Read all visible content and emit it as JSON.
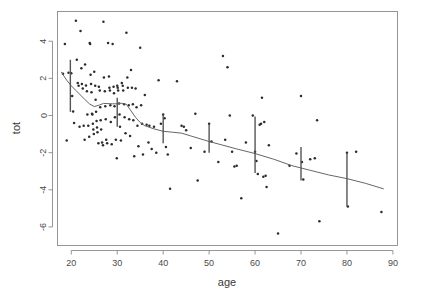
{
  "chart_data": {
    "type": "scatter",
    "title": "",
    "xlabel": "age",
    "ylabel": "tot",
    "xlim": [
      17,
      91
    ],
    "ylim": [
      -7,
      5.6
    ],
    "grid": false,
    "legend": "none",
    "xticks": [
      20,
      30,
      40,
      50,
      60,
      70,
      80,
      90
    ],
    "yticks": [
      4,
      2,
      0,
      -2,
      -4,
      -6
    ],
    "xtick_labels": [
      "20",
      "30",
      "40",
      "50",
      "60",
      "70",
      "80",
      "90"
    ],
    "ytick_labels": [
      "4",
      "2",
      "0",
      "-2",
      "-4",
      "-6"
    ],
    "series": [
      {
        "name": "observations",
        "type": "scatter",
        "marker": "dot",
        "color": "#2b2b2b",
        "points": [
          [
            18.2,
            2.25
          ],
          [
            18.6,
            3.85
          ],
          [
            19.0,
            -1.35
          ],
          [
            19.4,
            2.3
          ],
          [
            20.0,
            2.28
          ],
          [
            20.2,
            1.05
          ],
          [
            20.4,
            0.22
          ],
          [
            20.6,
            -0.4
          ],
          [
            21.0,
            5.1
          ],
          [
            21.2,
            3.0
          ],
          [
            21.4,
            1.75
          ],
          [
            21.6,
            1.6
          ],
          [
            21.8,
            -0.6
          ],
          [
            22.0,
            4.55
          ],
          [
            22.2,
            2.55
          ],
          [
            22.3,
            1.7
          ],
          [
            22.5,
            1.45
          ],
          [
            22.7,
            -0.55
          ],
          [
            22.9,
            -1.3
          ],
          [
            23.0,
            2.75
          ],
          [
            23.2,
            1.62
          ],
          [
            23.4,
            1.3
          ],
          [
            23.5,
            0.05
          ],
          [
            23.7,
            -0.55
          ],
          [
            23.9,
            -1.15
          ],
          [
            24.0,
            3.9
          ],
          [
            24.1,
            3.85
          ],
          [
            24.2,
            2.2
          ],
          [
            24.3,
            1.7
          ],
          [
            24.4,
            1.25
          ],
          [
            24.5,
            0.1
          ],
          [
            24.6,
            0.05
          ],
          [
            24.7,
            -0.45
          ],
          [
            24.8,
            -0.75
          ],
          [
            24.9,
            -1.0
          ],
          [
            25.0,
            2.35
          ],
          [
            25.2,
            1.6
          ],
          [
            25.3,
            0.85
          ],
          [
            25.4,
            0.2
          ],
          [
            25.5,
            -0.3
          ],
          [
            25.6,
            -0.65
          ],
          [
            25.7,
            -0.9
          ],
          [
            25.9,
            -1.5
          ],
          [
            26.0,
            1.55
          ],
          [
            26.2,
            1.35
          ],
          [
            26.3,
            0.45
          ],
          [
            26.4,
            -0.25
          ],
          [
            26.5,
            -0.75
          ],
          [
            26.7,
            -1.45
          ],
          [
            26.9,
            -1.6
          ],
          [
            27.0,
            5.05
          ],
          [
            27.1,
            2.05
          ],
          [
            27.3,
            1.3
          ],
          [
            27.4,
            0.5
          ],
          [
            27.5,
            -0.2
          ],
          [
            27.6,
            -1.3
          ],
          [
            27.8,
            -1.5
          ],
          [
            28.0,
            3.9
          ],
          [
            28.2,
            2.1
          ],
          [
            28.3,
            1.5
          ],
          [
            28.4,
            1.35
          ],
          [
            28.5,
            0.55
          ],
          [
            28.6,
            -0.35
          ],
          [
            28.8,
            -1.55
          ],
          [
            29.0,
            3.85
          ],
          [
            29.2,
            1.55
          ],
          [
            29.3,
            1.2
          ],
          [
            29.4,
            0.5
          ],
          [
            29.5,
            -0.1
          ],
          [
            29.7,
            -1.3
          ],
          [
            29.9,
            -2.3
          ],
          [
            30.0,
            1.6
          ],
          [
            30.1,
            1.5
          ],
          [
            30.2,
            1.35
          ],
          [
            30.4,
            0.65
          ],
          [
            30.5,
            0.05
          ],
          [
            30.6,
            -0.6
          ],
          [
            30.8,
            -1.35
          ],
          [
            31.0,
            1.75
          ],
          [
            31.2,
            1.6
          ],
          [
            31.3,
            1.35
          ],
          [
            31.5,
            0.6
          ],
          [
            31.6,
            -0.1
          ],
          [
            31.8,
            -0.95
          ],
          [
            32.0,
            4.45
          ],
          [
            32.2,
            2.05
          ],
          [
            32.3,
            1.5
          ],
          [
            32.5,
            0.55
          ],
          [
            32.6,
            -0.2
          ],
          [
            32.8,
            -1.1
          ],
          [
            33.0,
            2.45
          ],
          [
            33.2,
            1.5
          ],
          [
            33.4,
            0.6
          ],
          [
            33.5,
            -0.25
          ],
          [
            33.7,
            -2.2
          ],
          [
            34.0,
            1.45
          ],
          [
            34.2,
            0.45
          ],
          [
            34.4,
            -0.55
          ],
          [
            34.6,
            -1.65
          ],
          [
            35.0,
            3.65
          ],
          [
            35.2,
            0.55
          ],
          [
            35.4,
            -0.45
          ],
          [
            35.6,
            -2.1
          ],
          [
            36.0,
            1.1
          ],
          [
            36.4,
            -0.5
          ],
          [
            36.8,
            -1.45
          ],
          [
            37.0,
            -0.55
          ],
          [
            37.5,
            -1.8
          ],
          [
            38.0,
            -0.6
          ],
          [
            38.5,
            -2.0
          ],
          [
            39.0,
            1.9
          ],
          [
            39.5,
            -0.45
          ],
          [
            40.0,
            0.05
          ],
          [
            40.3,
            -0.15
          ],
          [
            40.6,
            -1.7
          ],
          [
            41.0,
            -2.1
          ],
          [
            41.5,
            -3.95
          ],
          [
            43.0,
            1.85
          ],
          [
            44.0,
            -0.55
          ],
          [
            44.5,
            -0.6
          ],
          [
            45.0,
            -0.8
          ],
          [
            46.0,
            -1.75
          ],
          [
            47.0,
            0.1
          ],
          [
            47.5,
            -3.5
          ],
          [
            49.0,
            -1.95
          ],
          [
            50.0,
            -0.45
          ],
          [
            50.5,
            -1.4
          ],
          [
            52.0,
            -2.5
          ],
          [
            53.0,
            3.2
          ],
          [
            53.5,
            -1.3
          ],
          [
            54.0,
            2.6
          ],
          [
            54.5,
            0.0
          ],
          [
            55.0,
            -1.95
          ],
          [
            55.5,
            -2.75
          ],
          [
            56.0,
            -2.7
          ],
          [
            57.0,
            -4.45
          ],
          [
            58.0,
            -1.45
          ],
          [
            59.5,
            0.0
          ],
          [
            60.0,
            -1.95
          ],
          [
            60.3,
            -2.45
          ],
          [
            60.6,
            -3.15
          ],
          [
            61.0,
            -0.5
          ],
          [
            61.3,
            -0.45
          ],
          [
            61.5,
            0.95
          ],
          [
            61.8,
            -3.3
          ],
          [
            62.0,
            -0.35
          ],
          [
            62.3,
            -3.25
          ],
          [
            62.5,
            -3.85
          ],
          [
            63.0,
            -1.6
          ],
          [
            65.0,
            -6.35
          ],
          [
            67.5,
            -2.7
          ],
          [
            69.0,
            -2.05
          ],
          [
            70.0,
            1.05
          ],
          [
            70.2,
            -2.5
          ],
          [
            70.5,
            -3.45
          ],
          [
            72.0,
            -2.35
          ],
          [
            73.0,
            -2.3
          ],
          [
            73.5,
            -0.25
          ],
          [
            74.0,
            -5.7
          ],
          [
            80.0,
            -2.0
          ],
          [
            80.2,
            -4.9
          ],
          [
            82.0,
            -1.95
          ],
          [
            87.5,
            -5.2
          ]
        ]
      }
    ],
    "trend": {
      "name": "loess-smooth",
      "color": "#666666",
      "points": [
        [
          17.8,
          2.35
        ],
        [
          19.0,
          1.9
        ],
        [
          20.0,
          1.6
        ],
        [
          21.0,
          1.35
        ],
        [
          22.0,
          1.1
        ],
        [
          23.0,
          0.85
        ],
        [
          24.0,
          0.62
        ],
        [
          25.0,
          0.48
        ],
        [
          26.0,
          0.55
        ],
        [
          27.0,
          0.65
        ],
        [
          28.0,
          0.64
        ],
        [
          29.0,
          0.63
        ],
        [
          30.0,
          0.63
        ],
        [
          31.0,
          0.66
        ],
        [
          32.0,
          0.6
        ],
        [
          33.0,
          0.25
        ],
        [
          34.0,
          -0.1
        ],
        [
          35.0,
          -0.38
        ],
        [
          36.0,
          -0.55
        ],
        [
          38.0,
          -0.72
        ],
        [
          40.0,
          -0.85
        ],
        [
          42.0,
          -0.9
        ],
        [
          44.0,
          -0.95
        ],
        [
          46.0,
          -1.1
        ],
        [
          48.0,
          -1.25
        ],
        [
          50.0,
          -1.4
        ],
        [
          53.0,
          -1.6
        ],
        [
          56.0,
          -1.8
        ],
        [
          60.0,
          -2.05
        ],
        [
          64.0,
          -2.35
        ],
        [
          68.0,
          -2.7
        ],
        [
          72.0,
          -2.95
        ],
        [
          76.0,
          -3.2
        ],
        [
          80.0,
          -3.4
        ],
        [
          84.0,
          -3.65
        ],
        [
          88.0,
          -3.95
        ]
      ]
    },
    "error_bars": [
      {
        "x": 19.8,
        "center": 1.65,
        "low": 0.2,
        "high": 3.0
      },
      {
        "x": 30.0,
        "center": 0.7,
        "low": -0.6,
        "high": 0.95
      },
      {
        "x": 40.0,
        "center": -0.7,
        "low": -1.5,
        "high": 0.05
      },
      {
        "x": 50.0,
        "center": -1.25,
        "low": -2.0,
        "high": -0.5
      },
      {
        "x": 60.0,
        "center": -1.95,
        "low": -3.1,
        "high": -0.05
      },
      {
        "x": 70.0,
        "center": -2.7,
        "low": -3.5,
        "high": -1.7
      },
      {
        "x": 80.0,
        "center": -3.4,
        "low": -4.9,
        "high": -2.0
      }
    ]
  }
}
